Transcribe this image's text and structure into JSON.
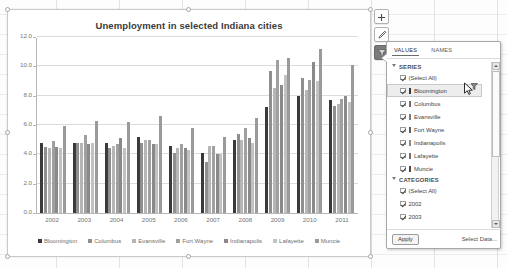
{
  "chart_data": {
    "type": "bar",
    "title": "Unemployment in selected Indiana cities",
    "xlabel": "",
    "ylabel": "",
    "ylim": [
      0.0,
      12.0
    ],
    "yticks": [
      "0.0",
      "2.0",
      "4.0",
      "6.0",
      "8.0",
      "10.0",
      "12.0"
    ],
    "grid": true,
    "legend_position": "bottom",
    "categories": [
      "2002",
      "2003",
      "2004",
      "2005",
      "2006",
      "2007",
      "2008",
      "2009",
      "2010",
      "2011"
    ],
    "series": [
      {
        "name": "Bloomington",
        "color": "#3a3a3a",
        "values": [
          4.8,
          4.8,
          4.8,
          5.2,
          4.6,
          4.1,
          5.0,
          7.2,
          8.0,
          7.7
        ]
      },
      {
        "name": "Columbus",
        "color": "#8f8f8f",
        "values": [
          4.5,
          4.8,
          4.4,
          4.8,
          4.1,
          3.5,
          5.4,
          9.7,
          9.2,
          7.3
        ]
      },
      {
        "name": "Evansville",
        "color": "#b5b5b5",
        "values": [
          4.4,
          4.8,
          4.6,
          5.0,
          4.4,
          4.6,
          5.0,
          8.5,
          8.4,
          7.4
        ]
      },
      {
        "name": "Fort Wayne",
        "color": "#a0a0a0",
        "values": [
          4.9,
          5.3,
          4.7,
          5.0,
          4.7,
          4.6,
          5.8,
          10.4,
          9.1,
          7.8
        ]
      },
      {
        "name": "Indianapolis",
        "color": "#8a8a8a",
        "values": [
          4.5,
          4.7,
          5.1,
          4.7,
          4.4,
          4.0,
          5.1,
          8.7,
          10.3,
          8.0
        ]
      },
      {
        "name": "Lafayette",
        "color": "#c2c2c2",
        "values": [
          4.4,
          4.8,
          4.4,
          4.7,
          4.3,
          4.0,
          4.8,
          9.4,
          9.0,
          7.6
        ]
      },
      {
        "name": "Muncie",
        "color": "#9a9a9a",
        "values": [
          5.9,
          6.3,
          6.2,
          6.6,
          5.8,
          5.2,
          6.5,
          10.6,
          11.2,
          10.1
        ]
      }
    ]
  },
  "chart_tools": {
    "add_element_label": "+",
    "styles_label": "brush",
    "filters_label": "funnel"
  },
  "filter_pane": {
    "tabs": [
      {
        "label": "VALUES",
        "active": true
      },
      {
        "label": "NAMES",
        "active": false
      }
    ],
    "sections": [
      {
        "title": "SERIES",
        "expanded": true,
        "rows": [
          {
            "label": "(Select All)",
            "checked": true,
            "swatch": null,
            "selected": false
          },
          {
            "label": "Bloomington",
            "checked": true,
            "swatch": "#3a3a3a",
            "selected": true
          },
          {
            "label": "Columbus",
            "checked": true,
            "swatch": "#6e6e6e",
            "selected": false
          },
          {
            "label": "Evansville",
            "checked": true,
            "swatch": "#7d7d7d",
            "selected": false
          },
          {
            "label": "Fort Wayne",
            "checked": true,
            "swatch": "#5f5f5f",
            "selected": false
          },
          {
            "label": "Indianapolis",
            "checked": true,
            "swatch": "#8a8a8a",
            "selected": false
          },
          {
            "label": "Lafayette",
            "checked": true,
            "swatch": "#707070",
            "selected": false
          },
          {
            "label": "Muncie",
            "checked": true,
            "swatch": "#4a4a4a",
            "selected": false
          }
        ]
      },
      {
        "title": "CATEGORIES",
        "expanded": true,
        "rows": [
          {
            "label": "(Select All)",
            "checked": true,
            "swatch": null,
            "selected": false
          },
          {
            "label": "2002",
            "checked": true,
            "swatch": null,
            "selected": false
          },
          {
            "label": "2003",
            "checked": true,
            "swatch": null,
            "selected": false
          }
        ]
      }
    ],
    "footer": {
      "apply_label": "Apply",
      "select_data_label": "Select Data..."
    }
  }
}
